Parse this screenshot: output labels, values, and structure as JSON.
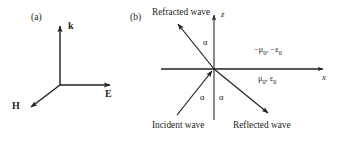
{
  "figure": {
    "panel_a": {
      "letter": "(a)",
      "vectors": [
        {
          "label": "k",
          "direction": "up"
        },
        {
          "label": "E",
          "direction": "right"
        },
        {
          "label": "H",
          "direction": "down-left"
        }
      ]
    },
    "panel_b": {
      "letter": "(b)",
      "axes": {
        "vertical": "z",
        "horizontal": "x"
      },
      "waves": {
        "refracted": "Refracted wave",
        "incident": "Incident wave",
        "reflected": "Reflected wave"
      },
      "angles": [
        {
          "name": "alpha-refracted",
          "label": "α"
        },
        {
          "name": "alpha-incident",
          "label": "α"
        },
        {
          "name": "alpha-reflected",
          "label": "α"
        }
      ],
      "media": {
        "upper_mu": "−μ",
        "upper_mu_sub": "0",
        "upper_sep": ", ",
        "upper_eps": "−ε",
        "upper_eps_sub": "0",
        "lower_mu": "μ",
        "lower_mu_sub": "0",
        "lower_sep": ", ",
        "lower_eps": "ε",
        "lower_eps_sub": "0"
      }
    }
  },
  "style": {
    "ink": "#231f20",
    "background": "#ffffff"
  }
}
